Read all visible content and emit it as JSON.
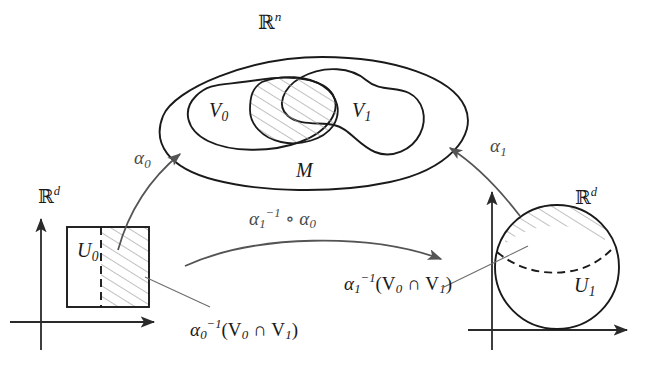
{
  "figure": {
    "stroke_color": "#1a1a1a",
    "arrow_color": "#545454",
    "hatch_color": "#9a9a9a",
    "background": "#ffffff"
  },
  "ambient": {
    "space_label_base": "R",
    "space_label_exp": "n"
  },
  "manifold": {
    "label": "M",
    "neighborhood_0": {
      "base": "V",
      "sub": "0"
    },
    "neighborhood_1": {
      "base": "V",
      "sub": "1"
    },
    "intersection_hatched": "V0-cap-V1"
  },
  "chart_left": {
    "space_label_base": "R",
    "space_label_exp": "d",
    "domain_base": "U",
    "domain_sub": "0",
    "preimage_label": {
      "base": "α",
      "sub": "0",
      "sup": "−1",
      "body": "(V",
      "body_sub": "0",
      "cap": " ∩ V",
      "cap_sub": "1",
      "close": ")"
    }
  },
  "chart_right": {
    "space_label_base": "R",
    "space_label_exp": "d",
    "domain_base": "U",
    "domain_sub": "1",
    "preimage_label": {
      "base": "α",
      "sub": "1",
      "sup": "−1",
      "body": "(V",
      "body_sub": "0",
      "cap": " ∩ V",
      "cap_sub": "1",
      "close": ")"
    }
  },
  "maps": {
    "alpha_0": {
      "base": "α",
      "sub": "0"
    },
    "alpha_1": {
      "base": "α",
      "sub": "1"
    },
    "transition": {
      "base": "α",
      "sub": "1",
      "sup": "−1",
      "compose": " ∘ α",
      "compose_sub": "0"
    }
  }
}
